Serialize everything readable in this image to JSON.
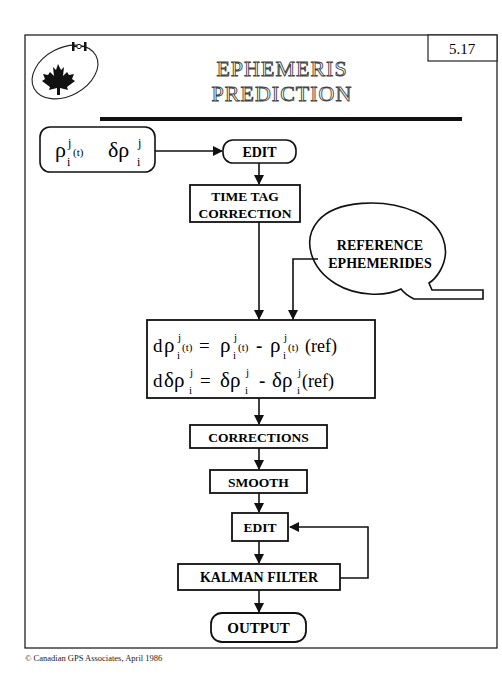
{
  "slide": {
    "page_number": "5.17",
    "title_line1": "EPHEMERIS",
    "title_line2": "PREDICTION",
    "logo": "canadian-maple-leaf-satellite-orbit-logo"
  },
  "flowchart": {
    "input": {
      "sym1": "ρ",
      "sup1": "j",
      "sub1": "i",
      "arg1": "(t)",
      "sym2": "δρ",
      "sup2": "j",
      "sub2": "i"
    },
    "edit1": "EDIT",
    "time_tag_line1": "TIME TAG",
    "time_tag_line2": "CORRECTION",
    "reference_line1": "REFERENCE",
    "reference_line2": "EPHEMERIDES",
    "equations": {
      "eq1": {
        "d": "d",
        "rho": "ρ",
        "j": "j",
        "i": "i",
        "t": "(t)",
        "eq": "=",
        "minus": "-",
        "ref": "(ref)"
      },
      "eq2": {
        "d": "d",
        "drho": "δρ",
        "j": "j",
        "i": "i",
        "eq": "=",
        "minus": "-",
        "ref": "(ref)"
      }
    },
    "corrections": "CORRECTIONS",
    "smooth": "SMOOTH",
    "edit2": "EDIT",
    "kalman": "KALMAN FILTER",
    "output": "OUTPUT"
  },
  "footer": {
    "copyright": "©  Canadian GPS Associates,  April 1986"
  }
}
